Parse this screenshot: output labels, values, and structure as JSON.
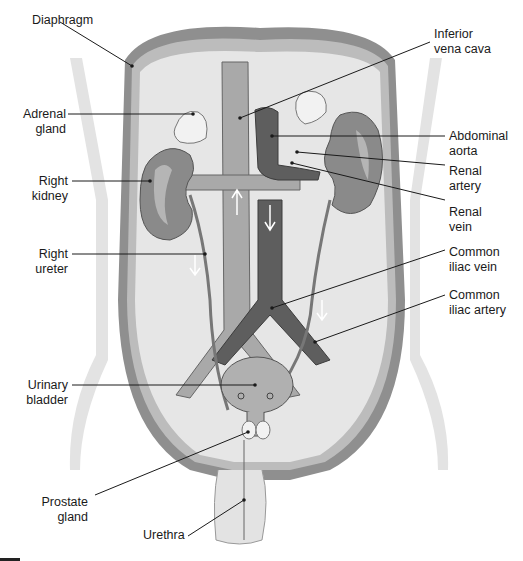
{
  "diagram": {
    "colors": {
      "background": "#ffffff",
      "cavity": "#e6e6e6",
      "wall_outer": "#8c8c8c",
      "wall_inner": "#bdbdbd",
      "kidney": "#8a8a8a",
      "kidney_highlight": "#b5b5b5",
      "vena_cava": "#a8a8a8",
      "aorta": "#5e5e5e",
      "adrenal": "#f2f2f2",
      "bladder": "#b0b0b0",
      "leader_line": "#1a1a1a"
    },
    "labels_left": [
      {
        "id": "diaphragm",
        "text": "Diaphragm"
      },
      {
        "id": "adrenal-gland",
        "text": "Adrenal\ngland"
      },
      {
        "id": "right-kidney",
        "text": "Right\nkidney"
      },
      {
        "id": "right-ureter",
        "text": "Right\nureter"
      },
      {
        "id": "urinary-bladder",
        "text": "Urinary\nbladder"
      },
      {
        "id": "prostate-gland",
        "text": "Prostate\ngland"
      },
      {
        "id": "urethra",
        "text": "Urethra"
      }
    ],
    "labels_right": [
      {
        "id": "inferior-vena-cava",
        "text": "Inferior\nvena cava"
      },
      {
        "id": "abdominal-aorta",
        "text": "Abdominal\naorta"
      },
      {
        "id": "renal-artery",
        "text": "Renal\nartery"
      },
      {
        "id": "renal-vein",
        "text": "Renal\nvein"
      },
      {
        "id": "common-iliac-vein",
        "text": "Common\niliac vein"
      },
      {
        "id": "common-iliac-artery",
        "text": "Common\niliac artery"
      }
    ]
  }
}
